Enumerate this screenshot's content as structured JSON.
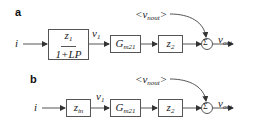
{
  "panels": [
    {
      "label": "a",
      "input": "i",
      "block1": {
        "numerator": "z",
        "numerator_sub": "1",
        "denominator": "1+LP"
      },
      "node": {
        "main": "v",
        "sub": "1"
      },
      "block2": {
        "main": "G",
        "sub": "m21"
      },
      "block3": {
        "main": "z",
        "sub": "2"
      },
      "noise": {
        "prefix": "<v",
        "sub": "nout",
        "suffix": ">"
      },
      "sum_symbol": "Σ",
      "output": {
        "main": "v",
        "sub": "out"
      }
    },
    {
      "label": "b",
      "input": "i",
      "block1": {
        "main": "z",
        "sub": "in"
      },
      "node": {
        "main": "v",
        "sub": "1"
      },
      "block2": {
        "main": "G",
        "sub": "m21"
      },
      "block3": {
        "main": "z",
        "sub": "2"
      },
      "noise": {
        "prefix": "<v",
        "sub": "nout",
        "suffix": ">"
      },
      "sum_symbol": "Σ",
      "output": {
        "main": "v",
        "sub": "out"
      }
    }
  ],
  "colors": {
    "line": "#555555",
    "text": "#222222",
    "background": "#ffffff"
  }
}
